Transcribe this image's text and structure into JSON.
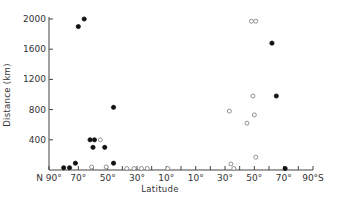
{
  "chart_data": {
    "type": "scatter",
    "title": "",
    "xlabel": "Latitude",
    "ylabel": "Distance (km)",
    "xlim": [
      -90,
      90
    ],
    "ylim": [
      0,
      2000
    ],
    "x_ticks": [
      -90,
      -70,
      -50,
      -30,
      -10,
      10,
      30,
      50,
      70,
      90
    ],
    "x_tick_labels": [
      "N 90°",
      "70°",
      "50°",
      "30°",
      "10°",
      "10°",
      "30°",
      "50°",
      "70°",
      "90°S"
    ],
    "y_ticks": [
      400,
      800,
      1200,
      1600,
      2000
    ],
    "y_tick_labels": [
      "400",
      "800",
      "1200",
      "1600",
      "2000"
    ],
    "grid": false,
    "legend": null,
    "note": "Negative latitude = North, positive = South",
    "series": [
      {
        "name": "filled",
        "marker": "filled-circle",
        "points": [
          {
            "lat": -66,
            "km": 2000
          },
          {
            "lat": -70,
            "km": 1900
          },
          {
            "lat": -46,
            "km": 830
          },
          {
            "lat": -62,
            "km": 400
          },
          {
            "lat": -59,
            "km": 400
          },
          {
            "lat": -60,
            "km": 300
          },
          {
            "lat": -52,
            "km": 300
          },
          {
            "lat": -46,
            "km": 90
          },
          {
            "lat": -72,
            "km": 90
          },
          {
            "lat": -80,
            "km": 30
          },
          {
            "lat": -76,
            "km": 30
          },
          {
            "lat": 62,
            "km": 1680
          },
          {
            "lat": 65,
            "km": 980
          },
          {
            "lat": 71,
            "km": 20
          }
        ]
      },
      {
        "name": "open",
        "marker": "open-circle",
        "points": [
          {
            "lat": -55,
            "km": 400
          },
          {
            "lat": -61,
            "km": 40
          },
          {
            "lat": -51,
            "km": 40
          },
          {
            "lat": -37,
            "km": 20
          },
          {
            "lat": -32,
            "km": 20
          },
          {
            "lat": -27,
            "km": 20
          },
          {
            "lat": -23,
            "km": 20
          },
          {
            "lat": -9,
            "km": 20
          },
          {
            "lat": 48,
            "km": 1970
          },
          {
            "lat": 51,
            "km": 1970
          },
          {
            "lat": 49,
            "km": 980
          },
          {
            "lat": 33,
            "km": 780
          },
          {
            "lat": 50,
            "km": 730
          },
          {
            "lat": 45,
            "km": 620
          },
          {
            "lat": 51,
            "km": 170
          },
          {
            "lat": 34,
            "km": 80
          },
          {
            "lat": 36,
            "km": 20
          }
        ]
      }
    ]
  }
}
